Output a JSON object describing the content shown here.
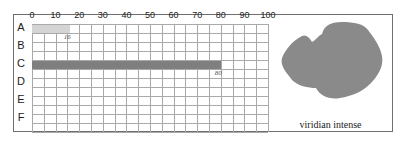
{
  "chart_data": {
    "type": "bar",
    "orientation": "horizontal",
    "title": "",
    "xlabel": "",
    "ylabel": "",
    "xlim": [
      0,
      100
    ],
    "x_ticks": [
      0,
      10,
      20,
      30,
      40,
      50,
      60,
      70,
      80,
      90,
      100
    ],
    "grid": true,
    "categories": [
      "A",
      "B",
      "C",
      "D",
      "E",
      "F"
    ],
    "values": [
      16,
      null,
      80,
      null,
      null,
      null
    ],
    "bar_colors": [
      "#d4d4d4",
      null,
      "#7f7f7f",
      null,
      null,
      null
    ],
    "data_labels": [
      "16",
      null,
      "80",
      null,
      null,
      null
    ]
  },
  "swatch": {
    "caption": "viridian intense",
    "color": "#8a8a8a"
  }
}
